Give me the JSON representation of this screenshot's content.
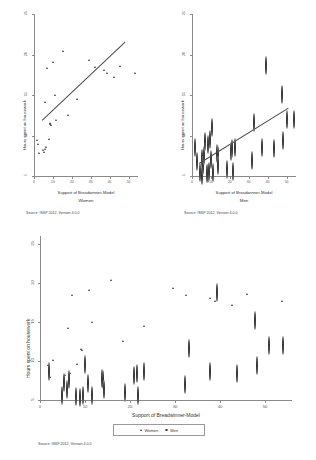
{
  "figure": {
    "source_note": "Source: ISSP 2012, Version 4.0.0"
  },
  "chart_data": [
    {
      "type": "scatter",
      "panel": "top-left",
      "title": "",
      "subtitle": "Women",
      "xlabel": "Support of Breadwinner-Model",
      "ylabel": "Hours spent on housework",
      "xlim": [
        0,
        55
      ],
      "ylim": [
        5,
        25
      ],
      "xticks": [
        0,
        10,
        20,
        30,
        40,
        50
      ],
      "yticks": [
        5,
        10,
        15,
        20,
        25
      ],
      "grid": false,
      "marker": "triangle",
      "legend": "none",
      "source": "Source: ISSP 2012, Version 4.0.0",
      "fit_line": {
        "x0": 4,
        "y0": 11.9,
        "x1": 48,
        "y1": 21.6
      },
      "points": [
        {
          "x": 2.0,
          "y": 11.5
        },
        {
          "x": 2.2,
          "y": 11.0
        },
        {
          "x": 3.1,
          "y": 9.9
        },
        {
          "x": 5.2,
          "y": 10.2
        },
        {
          "x": 5.6,
          "y": 10.0
        },
        {
          "x": 6.0,
          "y": 10.4
        },
        {
          "x": 6.2,
          "y": 16.2
        },
        {
          "x": 6.6,
          "y": 10.6
        },
        {
          "x": 7.0,
          "y": 20.4
        },
        {
          "x": 8.0,
          "y": 11.6
        },
        {
          "x": 8.6,
          "y": 13.4
        },
        {
          "x": 9.0,
          "y": 13.6
        },
        {
          "x": 9.3,
          "y": 13.3
        },
        {
          "x": 10.6,
          "y": 21.1
        },
        {
          "x": 11.2,
          "y": 17.0
        },
        {
          "x": 12.0,
          "y": 13.9
        },
        {
          "x": 15.8,
          "y": 22.4
        },
        {
          "x": 18.4,
          "y": 14.6
        },
        {
          "x": 22.8,
          "y": 16.5
        },
        {
          "x": 29.6,
          "y": 21.4
        },
        {
          "x": 32.6,
          "y": 20.5
        },
        {
          "x": 37.6,
          "y": 20.1
        },
        {
          "x": 38.8,
          "y": 19.8
        },
        {
          "x": 42.6,
          "y": 19.2
        },
        {
          "x": 46.0,
          "y": 20.6
        },
        {
          "x": 53.8,
          "y": 19.7
        }
      ]
    },
    {
      "type": "scatter",
      "panel": "top-right",
      "title": "",
      "subtitle": "Men",
      "xlabel": "Support of Breadwinner-Model",
      "ylabel": "Hours spent on housework",
      "xlim": [
        0,
        55
      ],
      "ylim": [
        5,
        25
      ],
      "xticks": [
        0,
        10,
        20,
        30,
        40,
        50
      ],
      "yticks": [
        5,
        10,
        15,
        20,
        25
      ],
      "grid": false,
      "marker": "circle",
      "legend": "none",
      "source": "Source: ISSP 2012, Version 4.0.0",
      "fit_line": {
        "x0": 3.5,
        "y0": 6.6,
        "x1": 50.5,
        "y1": 13.4
      },
      "points": [
        {
          "x": 2.0,
          "y": 9.4
        },
        {
          "x": 3.0,
          "y": 7.6
        },
        {
          "x": 4.8,
          "y": 6.3
        },
        {
          "x": 5.4,
          "y": 8.0
        },
        {
          "x": 5.8,
          "y": 5.9
        },
        {
          "x": 6.2,
          "y": 7.1
        },
        {
          "x": 6.8,
          "y": 8.4
        },
        {
          "x": 7.2,
          "y": 10.1
        },
        {
          "x": 8.0,
          "y": 6.2
        },
        {
          "x": 8.6,
          "y": 9.8
        },
        {
          "x": 9.0,
          "y": 6.1
        },
        {
          "x": 9.4,
          "y": 6.4
        },
        {
          "x": 10.0,
          "y": 10.4
        },
        {
          "x": 10.6,
          "y": 7.9
        },
        {
          "x": 11.0,
          "y": 11.9
        },
        {
          "x": 11.4,
          "y": 6.3
        },
        {
          "x": 13.6,
          "y": 8.6
        },
        {
          "x": 14.0,
          "y": 8.4
        },
        {
          "x": 14.2,
          "y": 7.1
        },
        {
          "x": 18.8,
          "y": 6.7
        },
        {
          "x": 20.8,
          "y": 8.9
        },
        {
          "x": 21.4,
          "y": 9.2
        },
        {
          "x": 21.8,
          "y": 6.4
        },
        {
          "x": 23.0,
          "y": 9.4
        },
        {
          "x": 32.2,
          "y": 7.8
        },
        {
          "x": 33.0,
          "y": 12.4
        },
        {
          "x": 37.6,
          "y": 9.4
        },
        {
          "x": 39.2,
          "y": 19.5
        },
        {
          "x": 43.6,
          "y": 9.2
        },
        {
          "x": 47.8,
          "y": 15.9
        },
        {
          "x": 48.2,
          "y": 10.2
        },
        {
          "x": 50.8,
          "y": 12.8
        },
        {
          "x": 54.0,
          "y": 12.8
        }
      ]
    },
    {
      "type": "scatter",
      "panel": "bottom",
      "title": "",
      "subtitle": "",
      "xlabel": "Support of Breadwinner-Model",
      "ylabel": "Hours spent on housework",
      "xlim": [
        0,
        56
      ],
      "ylim": [
        5,
        26
      ],
      "xticks": [
        0,
        10,
        20,
        30,
        40,
        50
      ],
      "yticks": [
        5,
        10,
        15,
        20,
        25
      ],
      "grid": false,
      "legend_position": "bottom",
      "source": "Source: ISSP 2012, Version 4.0.0",
      "series": [
        {
          "name": "Women",
          "marker": "triangle",
          "points": [
            {
              "x": 2.0,
              "y": 11.6
            },
            {
              "x": 3.1,
              "y": 12.2
            },
            {
              "x": 2.3,
              "y": 10.0
            },
            {
              "x": 5.6,
              "y": 10.3
            },
            {
              "x": 6.4,
              "y": 16.3
            },
            {
              "x": 6.8,
              "y": 10.5
            },
            {
              "x": 8.4,
              "y": 11.7
            },
            {
              "x": 9.2,
              "y": 13.6
            },
            {
              "x": 9.5,
              "y": 13.5
            },
            {
              "x": 11.0,
              "y": 21.2
            },
            {
              "x": 7.2,
              "y": 20.5
            },
            {
              "x": 11.6,
              "y": 17.1
            },
            {
              "x": 15.8,
              "y": 22.5
            },
            {
              "x": 18.6,
              "y": 14.7
            },
            {
              "x": 23.2,
              "y": 16.6
            },
            {
              "x": 29.6,
              "y": 21.5
            },
            {
              "x": 32.6,
              "y": 20.5
            },
            {
              "x": 37.8,
              "y": 20.2
            },
            {
              "x": 39.0,
              "y": 19.8
            },
            {
              "x": 42.8,
              "y": 19.3
            },
            {
              "x": 46.2,
              "y": 20.7
            },
            {
              "x": 54.0,
              "y": 19.8
            }
          ]
        },
        {
          "name": "Men",
          "marker": "circle",
          "points": [
            {
              "x": 2.1,
              "y": 9.5
            },
            {
              "x": 5.4,
              "y": 8.1
            },
            {
              "x": 5.0,
              "y": 6.4
            },
            {
              "x": 6.2,
              "y": 7.2
            },
            {
              "x": 6.6,
              "y": 8.5
            },
            {
              "x": 8.2,
              "y": 6.3
            },
            {
              "x": 9.0,
              "y": 6.2
            },
            {
              "x": 9.6,
              "y": 6.5
            },
            {
              "x": 10.2,
              "y": 10.4
            },
            {
              "x": 10.8,
              "y": 8.0
            },
            {
              "x": 11.6,
              "y": 6.4
            },
            {
              "x": 13.8,
              "y": 8.7
            },
            {
              "x": 14.2,
              "y": 8.5
            },
            {
              "x": 14.4,
              "y": 7.2
            },
            {
              "x": 19.0,
              "y": 6.8
            },
            {
              "x": 21.0,
              "y": 9.0
            },
            {
              "x": 21.6,
              "y": 9.3
            },
            {
              "x": 22.0,
              "y": 6.5
            },
            {
              "x": 23.2,
              "y": 9.5
            },
            {
              "x": 32.4,
              "y": 7.9
            },
            {
              "x": 33.2,
              "y": 12.5
            },
            {
              "x": 37.8,
              "y": 9.5
            },
            {
              "x": 39.4,
              "y": 19.6
            },
            {
              "x": 43.8,
              "y": 9.3
            },
            {
              "x": 48.0,
              "y": 16.0
            },
            {
              "x": 48.4,
              "y": 10.3
            },
            {
              "x": 51.0,
              "y": 12.9
            },
            {
              "x": 54.2,
              "y": 12.9
            }
          ]
        }
      ]
    }
  ]
}
